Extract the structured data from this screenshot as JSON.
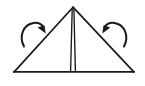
{
  "figure": {
    "background_color": "#ffffff",
    "ink_color": "#1a1a1a",
    "canvas": {
      "width": 145,
      "height": 86
    },
    "style": "hand-drawn black line sketch",
    "caption": ""
  },
  "chart_data": {
    "type": "diagram",
    "xlabel": "",
    "ylabel": "",
    "grid": false,
    "legend": false,
    "shapes": [
      {
        "name": "triangle",
        "kind": "polyline",
        "closed": false,
        "points": [
          [
            14,
            72
          ],
          [
            73,
            7
          ],
          [
            134,
            72
          ],
          [
            14,
            72
          ]
        ],
        "stroke_width": 1.6,
        "label": ""
      },
      {
        "name": "center-pole-left-edge",
        "kind": "line",
        "points": [
          [
            72,
            9
          ],
          [
            70.5,
            72
          ]
        ],
        "stroke_width": 1.3,
        "label": ""
      },
      {
        "name": "center-pole-right-edge",
        "kind": "line",
        "points": [
          [
            74,
            9
          ],
          [
            75.5,
            72
          ]
        ],
        "stroke_width": 1.3,
        "label": ""
      }
    ],
    "arrows": [
      {
        "name": "left-rotation-arrow",
        "direction": "clockwise",
        "points_toward": "apex",
        "arc_start": [
          23,
          46
        ],
        "arc_end": [
          41,
          31
        ],
        "arc_sweep": 1,
        "arc_radius": 13,
        "head_tip": [
          45,
          33
        ],
        "stroke_width": 2.0,
        "label": ""
      },
      {
        "name": "right-rotation-arrow",
        "direction": "counter-clockwise",
        "points_toward": "apex",
        "arc_start": [
          125,
          46
        ],
        "arc_end": [
          107,
          31
        ],
        "arc_sweep": 0,
        "arc_radius": 13,
        "head_tip": [
          103,
          33
        ],
        "stroke_width": 2.0,
        "label": ""
      }
    ],
    "annotations": []
  }
}
